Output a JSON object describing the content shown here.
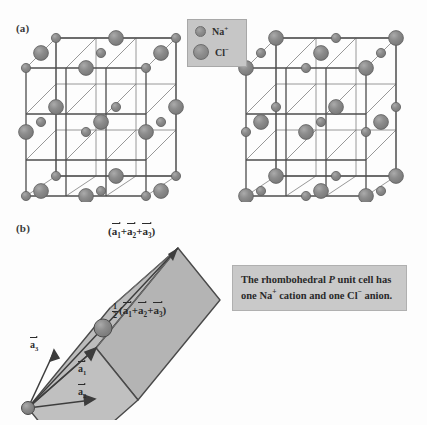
{
  "figure": {
    "panel_a_label": "(a)",
    "panel_b_label": "(b)",
    "background_color": "#fdfdfd"
  },
  "legend": {
    "box_color": "#c6c6c6",
    "items": [
      {
        "icon": "small-sphere-icon",
        "label": "Na",
        "charge": "+",
        "species": "sodium-cation",
        "radius_px": 4.5
      },
      {
        "icon": "large-sphere-icon",
        "label": "Cl",
        "charge": "−",
        "species": "chloride-anion",
        "radius_px": 7
      }
    ]
  },
  "panel_a": {
    "description": "Two rocksalt NaCl cubic lattice views",
    "sphere_fill": "#8d8d8d",
    "sphere_stroke": "#5f5f5f",
    "bond_color": "#6a6a6a",
    "left_cube": {
      "corner_species": "Na+",
      "grid": 3
    },
    "right_cube": {
      "corner_species": "Cl-",
      "grid": 3
    }
  },
  "panel_b": {
    "face_fill": "#b9b9b9",
    "edge_color": "#4a4a4a",
    "labels": {
      "corner_sum": {
        "open": "(",
        "a1": "a",
        "sub1": "1",
        "plus1": "+",
        "a2": "a",
        "sub2": "2",
        "plus2": "+",
        "a3": "a",
        "sub3": "3",
        "close": ")"
      },
      "body_center": {
        "num": "1",
        "den": "2",
        "open": "(",
        "a1": "a",
        "sub1": "1",
        "plus1": "+",
        "a2": "a",
        "sub2": "2",
        "plus2": "+",
        "a3": "a",
        "sub3": "3",
        "close": ")"
      },
      "vector_a1": {
        "symbol": "a",
        "index": "1"
      },
      "vector_a2": {
        "symbol": "a",
        "index": "2"
      },
      "vector_a3": {
        "symbol": "a",
        "index": "3"
      }
    },
    "caption": {
      "line1_pre": "The rhombohedral ",
      "line1_italic": "P",
      "line1_post": " unit",
      "line2_pre": "cell has one Na",
      "line2_sup": "+",
      "line2_post": " cation",
      "line3_pre": "and one Cl",
      "line3_sup": "−",
      "line3_post": " anion."
    }
  }
}
